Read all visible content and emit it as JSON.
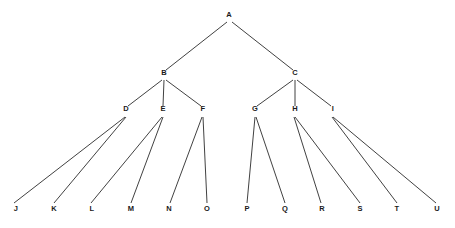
{
  "diagram": {
    "type": "tree",
    "title": "",
    "canvas": {
      "width": 455,
      "height": 228,
      "background": "#ffffff"
    },
    "style": {
      "edge_color": "#2b2b2b",
      "edge_width": 0.9,
      "label_color": "#1a1a1a",
      "label_font_size": 7.5
    },
    "levels": [
      {
        "index": 0,
        "y": 17,
        "nodes": [
          "A"
        ]
      },
      {
        "index": 1,
        "y": 75,
        "nodes": [
          "B",
          "C"
        ]
      },
      {
        "index": 2,
        "y": 111,
        "nodes": [
          "D",
          "E",
          "F",
          "G",
          "H",
          "I"
        ]
      },
      {
        "index": 3,
        "y": 211,
        "nodes": [
          "J",
          "K",
          "L",
          "M",
          "N",
          "O",
          "P",
          "Q",
          "R",
          "S",
          "T",
          "U"
        ]
      }
    ],
    "nodes": [
      {
        "id": "A",
        "label": "A",
        "x": 229,
        "y": 17,
        "level": 0
      },
      {
        "id": "B",
        "label": "B",
        "x": 164,
        "y": 75,
        "level": 1
      },
      {
        "id": "C",
        "label": "C",
        "x": 295,
        "y": 75,
        "level": 1
      },
      {
        "id": "D",
        "label": "D",
        "x": 126,
        "y": 111,
        "level": 2
      },
      {
        "id": "E",
        "label": "E",
        "x": 163,
        "y": 111,
        "level": 2
      },
      {
        "id": "F",
        "label": "F",
        "x": 203,
        "y": 111,
        "level": 2
      },
      {
        "id": "G",
        "label": "G",
        "x": 255,
        "y": 111,
        "level": 2
      },
      {
        "id": "H",
        "label": "H",
        "x": 295,
        "y": 111,
        "level": 2
      },
      {
        "id": "I",
        "label": "I",
        "x": 333,
        "y": 111,
        "level": 2
      },
      {
        "id": "J",
        "label": "J",
        "x": 16,
        "y": 211,
        "level": 3
      },
      {
        "id": "K",
        "label": "K",
        "x": 54,
        "y": 211,
        "level": 3
      },
      {
        "id": "L",
        "label": "L",
        "x": 92,
        "y": 211,
        "level": 3
      },
      {
        "id": "M",
        "label": "M",
        "x": 131,
        "y": 211,
        "level": 3
      },
      {
        "id": "N",
        "label": "N",
        "x": 169,
        "y": 211,
        "level": 3
      },
      {
        "id": "O",
        "label": "O",
        "x": 207,
        "y": 211,
        "level": 3
      },
      {
        "id": "P",
        "label": "P",
        "x": 247,
        "y": 211,
        "level": 3
      },
      {
        "id": "Q",
        "label": "Q",
        "x": 285,
        "y": 211,
        "level": 3
      },
      {
        "id": "R",
        "label": "R",
        "x": 322,
        "y": 211,
        "level": 3
      },
      {
        "id": "S",
        "label": "S",
        "x": 360,
        "y": 211,
        "level": 3
      },
      {
        "id": "T",
        "label": "T",
        "x": 397,
        "y": 211,
        "level": 3
      },
      {
        "id": "U",
        "label": "U",
        "x": 437,
        "y": 211,
        "level": 3
      }
    ],
    "edges": [
      {
        "from": "A",
        "to": "B",
        "x1": 227,
        "y1": 22,
        "x2": 166,
        "y2": 70
      },
      {
        "from": "A",
        "to": "C",
        "x1": 232,
        "y1": 22,
        "x2": 293,
        "y2": 70
      },
      {
        "from": "B",
        "to": "D",
        "x1": 162,
        "y1": 80,
        "x2": 128,
        "y2": 106
      },
      {
        "from": "B",
        "to": "E",
        "x1": 164,
        "y1": 80,
        "x2": 163,
        "y2": 106
      },
      {
        "from": "B",
        "to": "F",
        "x1": 166,
        "y1": 80,
        "x2": 201,
        "y2": 106
      },
      {
        "from": "C",
        "to": "G",
        "x1": 293,
        "y1": 80,
        "x2": 257,
        "y2": 106
      },
      {
        "from": "C",
        "to": "H",
        "x1": 295,
        "y1": 80,
        "x2": 295,
        "y2": 106
      },
      {
        "from": "C",
        "to": "I",
        "x1": 297,
        "y1": 80,
        "x2": 331,
        "y2": 106
      },
      {
        "from": "D",
        "to": "J",
        "x1": 125,
        "y1": 117,
        "x2": 14,
        "y2": 203
      },
      {
        "from": "D",
        "to": "K",
        "x1": 126,
        "y1": 117,
        "x2": 54,
        "y2": 203
      },
      {
        "from": "E",
        "to": "L",
        "x1": 162,
        "y1": 117,
        "x2": 91,
        "y2": 203
      },
      {
        "from": "E",
        "to": "M",
        "x1": 163,
        "y1": 117,
        "x2": 131,
        "y2": 203
      },
      {
        "from": "F",
        "to": "N",
        "x1": 202,
        "y1": 117,
        "x2": 170,
        "y2": 203
      },
      {
        "from": "F",
        "to": "O",
        "x1": 203,
        "y1": 117,
        "x2": 207,
        "y2": 203
      },
      {
        "from": "G",
        "to": "P",
        "x1": 255,
        "y1": 117,
        "x2": 247,
        "y2": 203
      },
      {
        "from": "G",
        "to": "Q",
        "x1": 256,
        "y1": 117,
        "x2": 285,
        "y2": 203
      },
      {
        "from": "H",
        "to": "R",
        "x1": 294,
        "y1": 117,
        "x2": 321,
        "y2": 203
      },
      {
        "from": "H",
        "to": "S",
        "x1": 295,
        "y1": 117,
        "x2": 360,
        "y2": 203
      },
      {
        "from": "I",
        "to": "T",
        "x1": 332,
        "y1": 117,
        "x2": 397,
        "y2": 203
      },
      {
        "from": "I",
        "to": "U",
        "x1": 333,
        "y1": 117,
        "x2": 436,
        "y2": 203
      }
    ]
  }
}
